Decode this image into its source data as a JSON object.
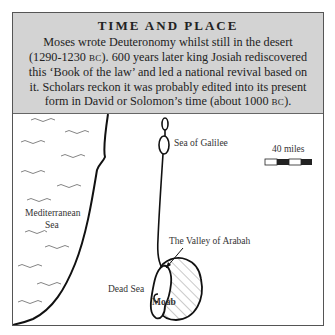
{
  "header": {
    "title": "TIME AND PLACE",
    "line1": "Moses wrote Deuteronomy whilst still in the desert",
    "line2_a": "(1290-1230 ",
    "line2_sc": "BC",
    "line2_b": "). 600 years later king Josiah rediscovered",
    "line3": "this ‘Book of the law’ and led a national revival based on",
    "line4": "it. Scholars reckon it was probably edited into its present",
    "line5_a": "form in David or Solomon’s time (about 1000 ",
    "line5_sc": "BC",
    "line5_b": ")."
  },
  "map": {
    "labels": {
      "sea_of_galilee": "Sea of Galilee",
      "mediterranean_1": "Mediterranean",
      "mediterranean_2": "Sea",
      "valley_of_arabah": "The Valley of Arabah",
      "dead_sea": "Dead Sea",
      "moab": "Moab"
    },
    "scale": {
      "label": "40 miles",
      "segments": [
        "white",
        "black",
        "white",
        "black"
      ]
    }
  }
}
